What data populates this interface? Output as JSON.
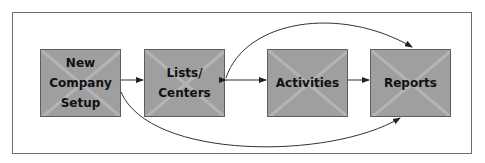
{
  "diagram": {
    "nodes": [
      {
        "id": "new-company-setup",
        "label": "New\nCompany\nSetup"
      },
      {
        "id": "lists-centers",
        "label": "Lists/\nCenters"
      },
      {
        "id": "activities",
        "label": "Activities"
      },
      {
        "id": "reports",
        "label": "Reports"
      }
    ],
    "edges": [
      {
        "from": "new-company-setup",
        "to": "lists-centers",
        "type": "straight"
      },
      {
        "from": "lists-centers",
        "to": "activities",
        "type": "bidirectional"
      },
      {
        "from": "activities",
        "to": "reports",
        "type": "straight"
      },
      {
        "from": "lists-centers",
        "to": "reports",
        "type": "curve-over"
      },
      {
        "from": "new-company-setup",
        "to": "reports",
        "type": "curve-under"
      }
    ],
    "colors": {
      "box_fill": "#9f9f9f",
      "box_border": "#5e5e5e",
      "line": "#333333",
      "frame": "#6e6e6e"
    }
  }
}
